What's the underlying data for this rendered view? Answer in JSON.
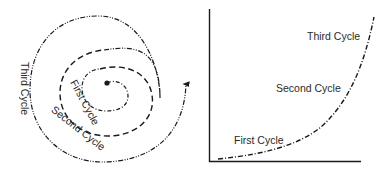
{
  "spiral": {
    "labels": {
      "first": "First Cycle",
      "second": "Second Cycle",
      "third": "Third Cycle"
    }
  },
  "curve_chart": {
    "labels": {
      "first": "First Cycle",
      "second": "Second Cycle",
      "third": "Third Cycle"
    }
  },
  "colors": {
    "line": "#1a1a1a",
    "text": "#2a2a2a",
    "background": "#ffffff"
  }
}
